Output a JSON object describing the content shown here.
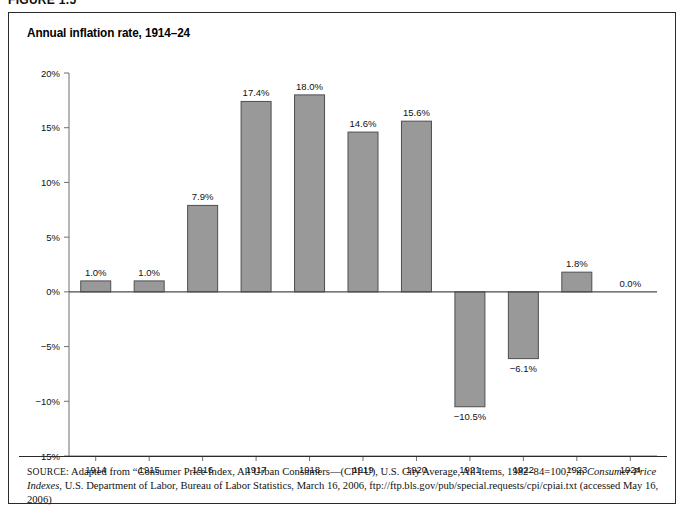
{
  "figure": {
    "number_label": "FIGURE 1.5"
  },
  "chart_title": "Annual inflation rate, 1914–24",
  "source": {
    "label": "SOURCE:",
    "line1_a": " Adapted from “Consumer Price Index, All Urban Consumers—(CPI-U), U.S. City Average, All Items, 1982–84=100,” in ",
    "line1_italic": "Consumer Price Indexes",
    "line1_b": ",",
    "line2": "U.S. Department of Labor, Bureau of Labor Statistics, March 16, 2006, ftp://ftp.bls.gov/pub/special.requests/cpi/cpiai.txt (accessed May 16, 2006)"
  },
  "chart_data": {
    "type": "bar",
    "title": "Annual inflation rate, 1914–24",
    "xlabel": "",
    "ylabel": "",
    "ylim": [
      -15,
      20
    ],
    "grid": false,
    "legend": null,
    "ytick_values": [
      20,
      15,
      10,
      5,
      0,
      -5,
      -10,
      -15
    ],
    "ytick_labels": [
      "20%",
      "15%",
      "10%",
      "5%",
      "0%",
      "−5%",
      "−10%",
      "−15%"
    ],
    "categories": [
      "1914",
      "1915",
      "1916",
      "1917",
      "1918",
      "1919",
      "1920",
      "1921",
      "1922",
      "1923",
      "1924"
    ],
    "values": [
      1.0,
      1.0,
      7.9,
      17.4,
      18.0,
      14.6,
      15.6,
      -10.5,
      -6.1,
      1.8,
      0.0
    ],
    "data_labels": [
      "1.0%",
      "1.0%",
      "7.9%",
      "17.4%",
      "18.0%",
      "14.6%",
      "15.6%",
      "−10.5%",
      "−6.1%",
      "1.8%",
      "0.0%"
    ],
    "bar_color": "#999999",
    "bar_edge_color": "#4f4f4f",
    "axis_color": "#6f6f6f"
  }
}
